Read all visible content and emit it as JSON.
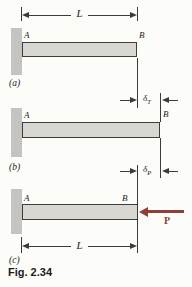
{
  "figure": {
    "caption": "Fig. 2.34",
    "colors": {
      "bar_fill": "#d9d7d1",
      "wall_fill": "#c5c4c1",
      "line": "#3b3b3b",
      "load_accent": "#8e4038",
      "background": "#fcfcf9"
    },
    "labels": {
      "length": "L",
      "point_a": "A",
      "point_b": "B",
      "load": "P",
      "delta_symbol": "δ",
      "delta_t_subscript": "T",
      "delta_p_subscript": "P",
      "section_a": "(a)",
      "section_b": "(b)",
      "section_c": "(c)"
    }
  }
}
